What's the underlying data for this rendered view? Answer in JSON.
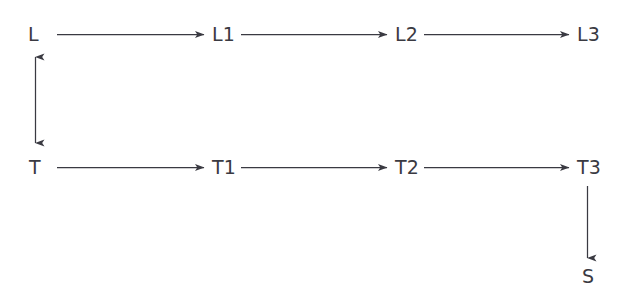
{
  "diagram": {
    "type": "flowchart",
    "background_color": "#ffffff",
    "stroke_color": "#3a3a42",
    "text_color": "#3a3a42",
    "nodes": [
      {
        "id": "L",
        "label": "L",
        "x": 28,
        "y": 25,
        "row": "top"
      },
      {
        "id": "L1",
        "label": "L1",
        "x": 212,
        "y": 25,
        "row": "top"
      },
      {
        "id": "L2",
        "label": "L2",
        "x": 395,
        "y": 25,
        "row": "top"
      },
      {
        "id": "L3",
        "label": "L3",
        "x": 577,
        "y": 25,
        "row": "top"
      },
      {
        "id": "T",
        "label": "T",
        "x": 29,
        "y": 158,
        "row": "bottom"
      },
      {
        "id": "T1",
        "label": "T1",
        "x": 212,
        "y": 158,
        "row": "bottom"
      },
      {
        "id": "T2",
        "label": "T2",
        "x": 395,
        "y": 158,
        "row": "bottom"
      },
      {
        "id": "T3",
        "label": "T3",
        "x": 577,
        "y": 158,
        "row": "bottom"
      },
      {
        "id": "S",
        "label": "S",
        "x": 582,
        "y": 267,
        "row": "sink"
      }
    ],
    "edges": [
      {
        "id": "edge-l-l1",
        "from": "L",
        "to": "L1",
        "direction": "right",
        "arrowheads": "single"
      },
      {
        "id": "edge-l1-l2",
        "from": "L1",
        "to": "L2",
        "direction": "right",
        "arrowheads": "single"
      },
      {
        "id": "edge-l2-l3",
        "from": "L2",
        "to": "L3",
        "direction": "right",
        "arrowheads": "single"
      },
      {
        "id": "edge-t-t1",
        "from": "T",
        "to": "T1",
        "direction": "right",
        "arrowheads": "single"
      },
      {
        "id": "edge-t1-t2",
        "from": "T1",
        "to": "T2",
        "direction": "right",
        "arrowheads": "single"
      },
      {
        "id": "edge-t2-t3",
        "from": "T2",
        "to": "T3",
        "direction": "right",
        "arrowheads": "single"
      },
      {
        "id": "edge-l-t",
        "from": "L",
        "to": "T",
        "direction": "vertical",
        "arrowheads": "double"
      },
      {
        "id": "edge-t3-s",
        "from": "T3",
        "to": "S",
        "direction": "down",
        "arrowheads": "single"
      }
    ]
  }
}
